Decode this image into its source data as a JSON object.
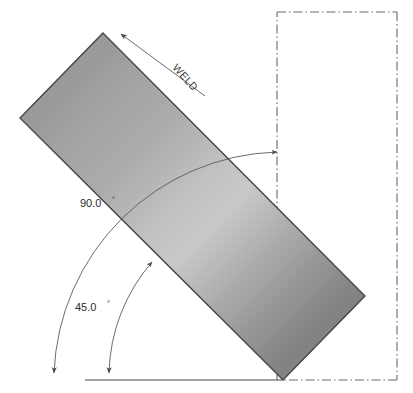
{
  "drawing": {
    "title": "Weld Plate Angle Detail",
    "labels": {
      "weld": "WELD",
      "angle_90": "90.0",
      "angle_90_unit": "°",
      "angle_45": "45.0",
      "angle_45_unit": "°"
    },
    "colors": {
      "plate_light": "#c9c9c9",
      "plate_mid": "#9a9a9a",
      "plate_dark": "#7e7e7e",
      "plate_edge": "#4d4d4d",
      "line": "#5a5a5a",
      "centerline": "#6a6a6a",
      "text": "#2b2b2b",
      "background": "#ffffff"
    },
    "geometry": {
      "canvas_width": 413,
      "canvas_height": 393,
      "plate_corners": [
        [
          103,
          33
        ],
        [
          20,
          118
        ],
        [
          283,
          380
        ],
        [
          365,
          296
        ]
      ],
      "plate_rotation_deg": 45,
      "centerline_rect": {
        "x": 277,
        "y": 12,
        "width": 120,
        "height": 368
      },
      "baseline": {
        "x1": 85,
        "y1": 380,
        "x2": 283,
        "y2": 380
      },
      "arc_90": {
        "center": [
          283,
          380
        ],
        "radius": 230,
        "start": [
          52,
          380
        ],
        "end": [
          283,
          154
        ]
      },
      "arc_45": {
        "center": [
          283,
          380
        ],
        "radius": 176,
        "start": [
          107,
          380
        ],
        "end": [
          155,
          258
        ]
      },
      "weld_leader": {
        "from": [
          205,
          96
        ],
        "to": [
          118,
          32
        ]
      }
    }
  }
}
